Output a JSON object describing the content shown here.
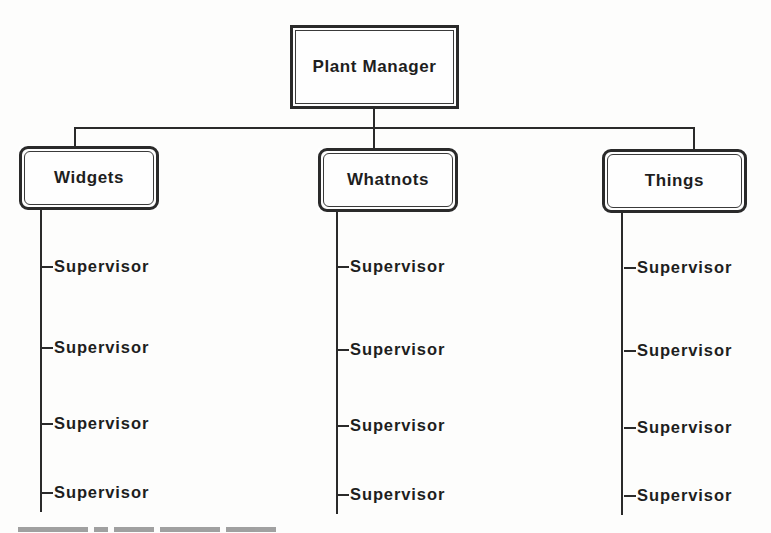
{
  "diagram": {
    "type": "org-chart",
    "root": {
      "label": "Plant Manager"
    },
    "departments": [
      {
        "label": "Widgets",
        "reports": [
          "Supervisor",
          "Supervisor",
          "Supervisor",
          "Supervisor"
        ]
      },
      {
        "label": "Whatnots",
        "reports": [
          "Supervisor",
          "Supervisor",
          "Supervisor",
          "Supervisor"
        ]
      },
      {
        "label": "Things",
        "reports": [
          "Supervisor",
          "Supervisor",
          "Supervisor",
          "Supervisor"
        ]
      }
    ]
  },
  "colors": {
    "ink": "#2a2a2a",
    "background": "#fdfdfc"
  }
}
